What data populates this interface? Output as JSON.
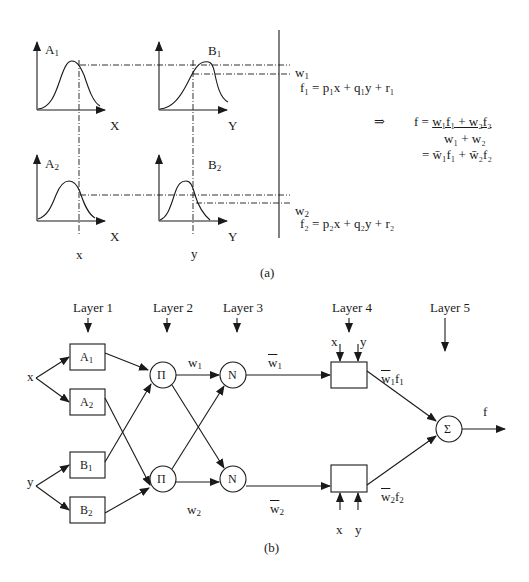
{
  "part_a": {
    "caption": "(a)",
    "plots": [
      {
        "id": "A1",
        "label": "A",
        "sub": "1",
        "axis": "X"
      },
      {
        "id": "B1",
        "label": "B",
        "sub": "1",
        "axis": "Y"
      },
      {
        "id": "A2",
        "label": "A",
        "sub": "2",
        "axis": "X"
      },
      {
        "id": "B2",
        "label": "B",
        "sub": "2",
        "axis": "Y"
      }
    ],
    "input_x": "x",
    "input_y": "y",
    "w1": {
      "base": "w",
      "sub": "1"
    },
    "w2": {
      "base": "w",
      "sub": "2"
    },
    "rule1": "f₁ = p₁x + q₁y + r₁",
    "rule2": "f₂ = p₂x + q₂y + r₂",
    "implies": "⇒",
    "formula_line1_left": "f = ",
    "formula_numerator": "w₁f₁ + w₂f₂",
    "formula_denominator": "w₁ + w₂",
    "formula_line3": "= w̄₁f₁ + w̄₂f₂"
  },
  "part_b": {
    "caption": "(b)",
    "layers": [
      "Layer 1",
      "Layer 2",
      "Layer 3",
      "Layer 4",
      "Layer 5"
    ],
    "inputs": {
      "x": "x",
      "y": "y"
    },
    "layer1_nodes": [
      {
        "base": "A",
        "sub": "1"
      },
      {
        "base": "A",
        "sub": "2"
      },
      {
        "base": "B",
        "sub": "1"
      },
      {
        "base": "B",
        "sub": "2"
      }
    ],
    "layer2_symbol": "Π",
    "layer3_symbol": "N",
    "layer5_symbol": "Σ",
    "w1": {
      "base": "w",
      "sub": "1"
    },
    "w2": {
      "base": "w",
      "sub": "2"
    },
    "wbar1": {
      "base": "w",
      "sub": "1"
    },
    "wbar2": {
      "base": "w",
      "sub": "2"
    },
    "out1": {
      "base": "w",
      "sub": "1",
      "f": "f",
      "fsub": "1"
    },
    "out2": {
      "base": "w",
      "sub": "2",
      "f": "f",
      "fsub": "2"
    },
    "layer4_inputs": [
      "x",
      "y"
    ],
    "output": "f"
  }
}
